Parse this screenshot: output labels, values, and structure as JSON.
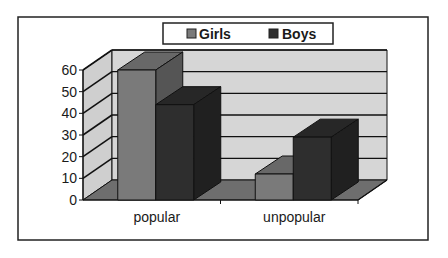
{
  "chart_data": {
    "type": "bar",
    "subtype": "3d-clustered-column",
    "title": "",
    "xlabel": "",
    "ylabel": "",
    "categories": [
      "popular",
      "unpopular"
    ],
    "series": [
      {
        "name": "Girls",
        "values": [
          60,
          12
        ],
        "color": "#7a7a7a"
      },
      {
        "name": "Boys",
        "values": [
          44,
          29
        ],
        "color": "#2e2e2e"
      }
    ],
    "ylim": [
      0,
      60
    ],
    "yticks": [
      "0",
      "10",
      "20",
      "30",
      "40",
      "50",
      "60"
    ],
    "grid": true,
    "legend_position": "top"
  },
  "legend": {
    "items": [
      {
        "label": "Girls"
      },
      {
        "label": "Boys"
      }
    ]
  },
  "colors": {
    "wall": "#d6d6d6",
    "side_wall": "#cfcfcf",
    "floor": "#6e6e6e",
    "gridline": "#111111",
    "border": "#222222"
  }
}
